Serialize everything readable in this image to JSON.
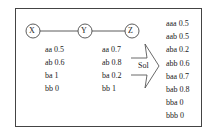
{
  "nodes": [
    {
      "label": "X",
      "cx": 33,
      "cy": 31
    },
    {
      "label": "Y",
      "cx": 85,
      "cy": 31
    },
    {
      "label": "Z",
      "cx": 132,
      "cy": 31
    }
  ],
  "tables": {
    "xy": [
      {
        "key": "aa",
        "value": "0.5"
      },
      {
        "key": "ab",
        "value": "0.6"
      },
      {
        "key": "ba",
        "value": "1"
      },
      {
        "key": "bb",
        "value": "0"
      }
    ],
    "yz": [
      {
        "key": "aa",
        "value": "0.7"
      },
      {
        "key": "ab",
        "value": "0.8"
      },
      {
        "key": "ba",
        "value": "0.2"
      },
      {
        "key": "bb",
        "value": "1"
      }
    ]
  },
  "arrow_label": "Sol",
  "result": [
    {
      "key": "aaa",
      "value": "0.5"
    },
    {
      "key": "aab",
      "value": "0.5"
    },
    {
      "key": "aba",
      "value": "0.2"
    },
    {
      "key": "abb",
      "value": "0.6"
    },
    {
      "key": "baa",
      "value": "0.7"
    },
    {
      "key": "bab",
      "value": "0.8"
    },
    {
      "key": "bba",
      "value": "0"
    },
    {
      "key": "bbb",
      "value": "0"
    }
  ]
}
